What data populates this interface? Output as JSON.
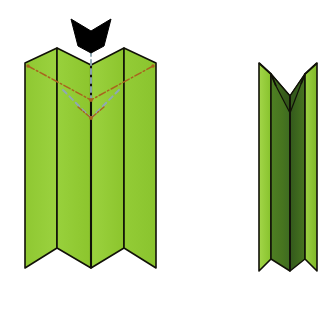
{
  "diagram": {
    "type": "origami-fold-instruction",
    "background_color": "#ffffff",
    "canvas": {
      "width": 331,
      "height": 313
    },
    "palette": {
      "paper_front": "#93CC36",
      "paper_front_light": "#9BD23F",
      "paper_front_alt": "#8AC42E",
      "paper_shadow_mid": "#5E8F28",
      "paper_shadow_dark": "#3E6B22",
      "paper_shadow_darkest": "#33591C",
      "outline": "#111108",
      "arrow_fill": "#000000",
      "valley_fold_line": "#A8641E",
      "mountain_fold_line": "#8FA8B4"
    },
    "figures": [
      {
        "id": "figure-before",
        "name": "pleated-sheet-before",
        "label": "Pleated sheet with fold guides",
        "panel_count": 4,
        "top_edge": "zigzag-w",
        "bottom_edge": "zigzag-w"
      },
      {
        "id": "figure-after",
        "name": "pleated-sheet-collapsed",
        "label": "Collapsed narrow pleat result",
        "panel_count": 4,
        "top_edge": "zigzag-v-notch",
        "bottom_edge": "zigzag-w"
      }
    ],
    "annotations": {
      "arrow": {
        "name": "push-arrow",
        "direction": "down",
        "style": "solid-black-chevron-head",
        "meaning": "press down here"
      },
      "fold_lines": [
        {
          "name": "valley-fold-left",
          "style": "dash-dot",
          "color": "#A8641E"
        },
        {
          "name": "valley-fold-right",
          "style": "dash-dot",
          "color": "#A8641E"
        },
        {
          "name": "mountain-fold-center-upper",
          "style": "dashed",
          "color": "#8FA8B4"
        },
        {
          "name": "mountain-fold-left-lower",
          "style": "dashed",
          "color": "#8FA8B4"
        },
        {
          "name": "mountain-fold-right-lower",
          "style": "dashed",
          "color": "#8FA8B4"
        }
      ]
    }
  }
}
